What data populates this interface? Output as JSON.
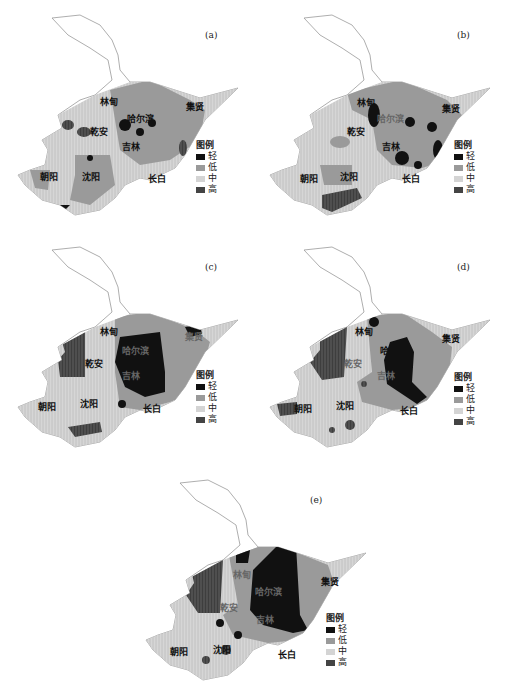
{
  "figure": {
    "panels": [
      {
        "id": "a",
        "label": "(a)"
      },
      {
        "id": "b",
        "label": "(b)"
      },
      {
        "id": "c",
        "label": "(c)"
      },
      {
        "id": "d",
        "label": "(d)"
      },
      {
        "id": "e",
        "label": "(e)"
      }
    ],
    "cities": {
      "linxian": "林甸",
      "harbin": "哈尔滨",
      "jixian": "集贤",
      "qianan": "乾安",
      "jilin": "吉林",
      "chaoyang": "朝阳",
      "shenyang": "沈阳",
      "changbai": "长白"
    },
    "legend": {
      "title": "图例",
      "items": [
        {
          "label": "轻",
          "color": "#111111"
        },
        {
          "label": "低",
          "color": "#9a9a9a"
        },
        {
          "label": "中",
          "color": "#d4d4d4"
        },
        {
          "label": "高",
          "color": "#444444"
        }
      ]
    }
  }
}
